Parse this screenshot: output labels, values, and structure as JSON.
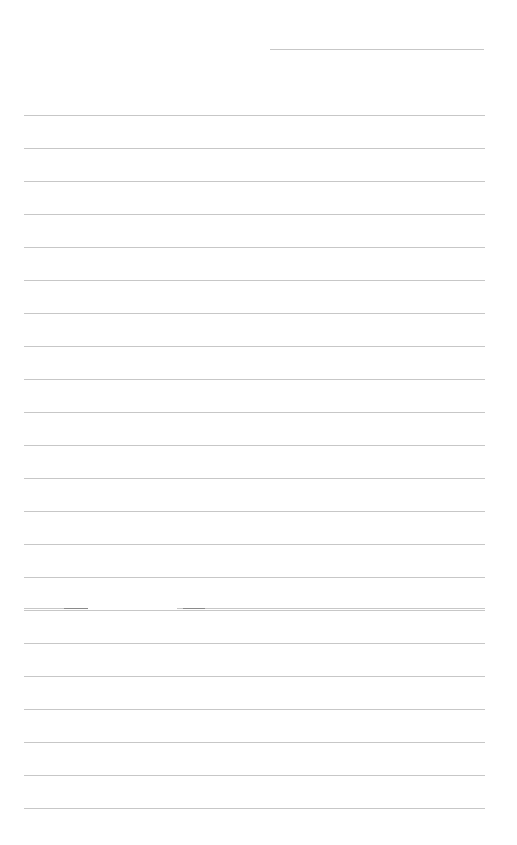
{
  "page": {
    "background": "#ffffff",
    "line_color": "#bdbdbd",
    "header_line": {
      "x1": 270,
      "x2": 484,
      "y": 49
    },
    "ruled_lines": {
      "x1": 24,
      "x2": 485,
      "start_y": 115,
      "spacing": 33,
      "count": 22
    },
    "broken_line": {
      "y": 608,
      "segments": [
        {
          "x1": 24,
          "x2": 88,
          "dark_from": 64
        },
        {
          "x1": 177,
          "x2": 485,
          "dark_to": 205
        }
      ]
    }
  }
}
